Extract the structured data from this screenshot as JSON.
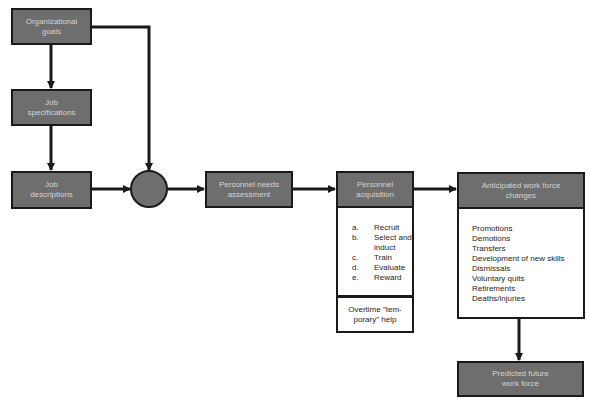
{
  "nodes": {
    "org_goals": "Organizational\ngoals",
    "job_specs": "Job\nspecifications",
    "job_desc": "Job\ndescriptions",
    "needs": "Personnel needs\nassessment",
    "acquisition": "Personnel\nacquisition",
    "anticipated": "Anticipated work force\nchanges",
    "predicted": "Predicted future\nwork force"
  },
  "acquisition_steps": [
    {
      "key": "a.",
      "label": "Recruit"
    },
    {
      "key": "b.",
      "label": "Select and\ninduct"
    },
    {
      "key": "c.",
      "label": "Train"
    },
    {
      "key": "d.",
      "label": "Evaluate"
    },
    {
      "key": "e.",
      "label": "Reward"
    }
  ],
  "acquisition_note": "Overtime \"tem-\nporary\" help",
  "workforce_changes": [
    "Promotions",
    "Demotions",
    "Transfers",
    "Development of new skills",
    "Dismissals",
    "Voluntary quits",
    "Retirements",
    "Deaths/injuries"
  ]
}
